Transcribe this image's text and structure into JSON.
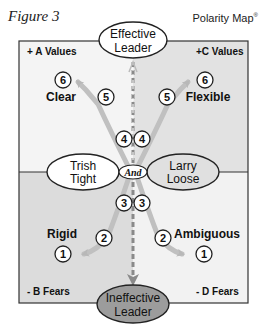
{
  "figure": {
    "title": "Figure 3",
    "brand": "Polarity Map",
    "brand_mark": "®"
  },
  "colors": {
    "border": "#333333",
    "quadrant_top_left": "#f4f4f4",
    "quadrant_top_right": "#e2e2e2",
    "quadrant_bottom_left": "#dcdcdc",
    "quadrant_bottom_right": "#f2f2f2",
    "arrow": "#b8b8b8",
    "ineffective_fill": "#9c9c9c",
    "loose_fill": "#e0e0e0"
  },
  "top_node": {
    "line1": "Effective",
    "line2": "Leader"
  },
  "bottom_node": {
    "line1": "Ineffective",
    "line2": "Leader"
  },
  "left_pole": {
    "line1": "Trish",
    "line2": "Tight"
  },
  "right_pole": {
    "line1": "Larry",
    "line2": "Loose"
  },
  "center_connector": "And",
  "quadrants": {
    "top_left": {
      "label": "+ A Values",
      "term": "Clear"
    },
    "top_right": {
      "label": "+C Values",
      "term": "Flexible"
    },
    "bottom_left": {
      "label": "- B Fears",
      "term": "Rigid"
    },
    "bottom_right": {
      "label": "- D Fears",
      "term": "Ambiguous"
    }
  },
  "steps": {
    "s1_left": "1",
    "s1_right": "1",
    "s2_left": "2",
    "s2_right": "2",
    "s3_left": "3",
    "s3_right": "3",
    "s4_left": "4",
    "s4_right": "4",
    "s5_left": "5",
    "s5_right": "5",
    "s6_left": "6",
    "s6_right": "6"
  }
}
